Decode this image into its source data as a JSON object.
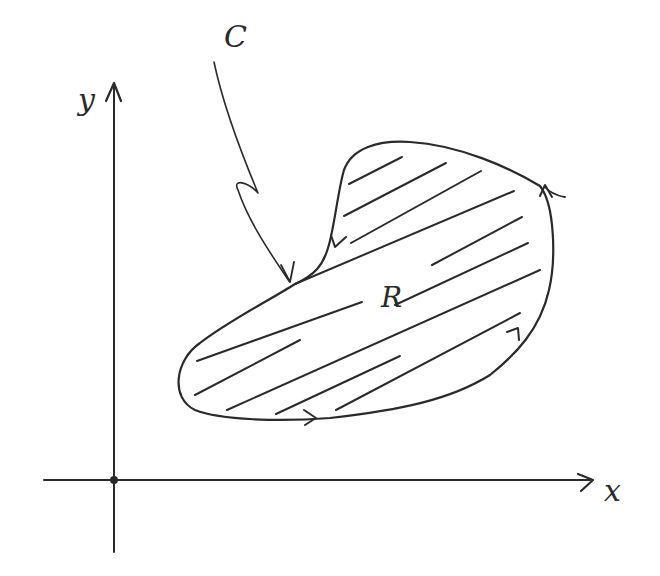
{
  "diagram": {
    "labels": {
      "x_axis": "x",
      "y_axis": "y",
      "curve": "C",
      "region": "R"
    },
    "curve_orientation": "counterclockwise",
    "origin_marked": true,
    "region_shading": "diagonal hatching",
    "colors": {
      "ink": "#2a2a2a",
      "background": "#ffffff"
    }
  }
}
